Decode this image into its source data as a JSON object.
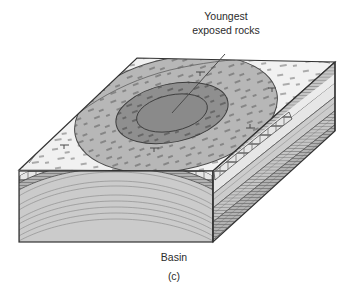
{
  "figure": {
    "caption_letter": "(c)",
    "structure_label": "Basin",
    "annotation": {
      "line1": "Youngest",
      "line2": "exposed rocks",
      "leader_icon": "leader-line-icon"
    },
    "diagram_type": "geologic-block-diagram",
    "colors": {
      "outline": "#333333",
      "top_surface_outer": "#f1f1f1",
      "ring_middle": "#b5b5b5",
      "core_inner": "#8d8d8d",
      "front_face_upper": "#cfcfcf",
      "front_face_lower": "#bdbdbd",
      "front_face_deep": "#b0b0b0",
      "limestone_band": "#e4e4e4",
      "side_face": "#c2c2c2",
      "side_face_dark": "#a9a9a9",
      "text": "#2b2b2b",
      "page_background": "#ffffff"
    },
    "layers": [
      {
        "name": "youngest-exposed-core",
        "pattern": "shale-dashes",
        "tone": "dark"
      },
      {
        "name": "middle-ring-unit",
        "pattern": "shale-dashes",
        "tone": "medium"
      },
      {
        "name": "outer-shale-unit",
        "pattern": "shale-dashes",
        "tone": "light"
      },
      {
        "name": "limestone-band",
        "pattern": "brick",
        "tone": "light"
      },
      {
        "name": "sandstone-beds",
        "pattern": "laminated-lines",
        "tone": "medium"
      },
      {
        "name": "basal-beds",
        "pattern": "laminated-lines",
        "tone": "dark"
      }
    ]
  }
}
